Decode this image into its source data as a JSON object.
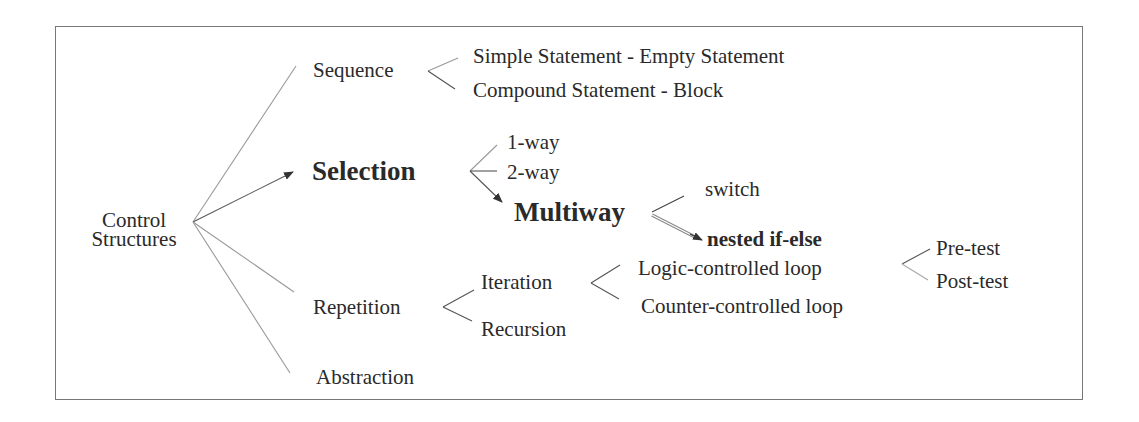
{
  "diagram": {
    "type": "tree",
    "root": {
      "label_line1": "Control",
      "label_line2": "Structures"
    },
    "level1": {
      "sequence": "Sequence",
      "selection": "Selection",
      "repetition": "Repetition",
      "abstraction": "Abstraction"
    },
    "sequence_children": {
      "simple": "Simple Statement - Empty Statement",
      "compound": "Compound Statement - Block"
    },
    "selection_children": {
      "one_way": "1-way",
      "two_way": "2-way",
      "multiway": "Multiway"
    },
    "multiway_children": {
      "switch": "switch",
      "nested": "nested if-else"
    },
    "repetition_children": {
      "iteration": "Iteration",
      "recursion": "Recursion"
    },
    "iteration_children": {
      "logic": "Logic-controlled loop",
      "counter": "Counter-controlled loop"
    },
    "logic_children": {
      "pre": "Pre-test",
      "post": "Post-test"
    },
    "colors": {
      "frame": "#777777",
      "line": "#999999",
      "arrow": "#333333",
      "text": "#2a2a2a"
    }
  }
}
